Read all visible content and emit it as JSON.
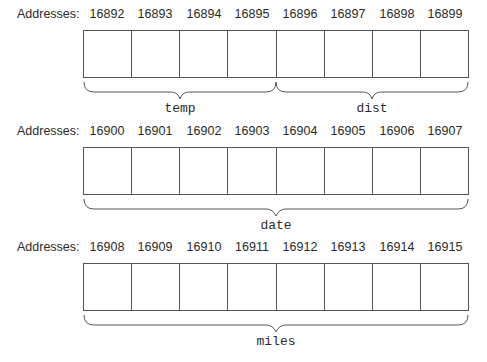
{
  "diagram": {
    "address_label": "Addresses:",
    "rows": [
      {
        "addresses": [
          "16892",
          "16893",
          "16894",
          "16895",
          "16896",
          "16897",
          "16898",
          "16899"
        ],
        "variables": [
          {
            "name": "temp",
            "start_cell": 0,
            "end_cell": 3
          },
          {
            "name": "dist",
            "start_cell": 4,
            "end_cell": 7
          }
        ]
      },
      {
        "addresses": [
          "16900",
          "16901",
          "16902",
          "16903",
          "16904",
          "16905",
          "16906",
          "16907"
        ],
        "variables": [
          {
            "name": "date",
            "start_cell": 0,
            "end_cell": 7
          }
        ]
      },
      {
        "addresses": [
          "16908",
          "16909",
          "16910",
          "16911",
          "16912",
          "16913",
          "16914",
          "16915"
        ],
        "variables": [
          {
            "name": "miles",
            "start_cell": 0,
            "end_cell": 7
          }
        ]
      }
    ]
  }
}
